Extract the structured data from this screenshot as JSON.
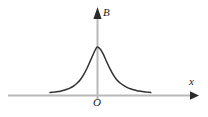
{
  "figure": {
    "background_color": "#ffffff",
    "axis_color": "#b3b3b3",
    "arrow_color": "#2b2b2b",
    "curve_color": "#33312f",
    "label_color": "#1a1a1a"
  },
  "labels": {
    "y_axis": "B",
    "x_axis": "x",
    "origin": "O"
  },
  "icons": {
    "y_arrow": "arrow-up-icon",
    "x_arrow": "arrow-right-icon"
  },
  "chart_data": {
    "type": "line",
    "title": "",
    "subtitle": "",
    "xlabel": "x",
    "ylabel": "B",
    "annotations": [
      "O"
    ],
    "legend": [],
    "legend_position": "none",
    "grid": false,
    "axis_style": "arrow-terminated",
    "xlim": [
      -70,
      100
    ],
    "ylim": [
      0,
      1.15
    ],
    "x_origin_px": 97,
    "y_baseline_px": 95,
    "series": [
      {
        "name": "B(x)",
        "x": [
          -69,
          -64,
          -59,
          -54,
          -49,
          -44,
          -39,
          -34,
          -29,
          -24,
          -19,
          -14,
          -9,
          -4,
          0,
          4,
          9,
          14,
          19,
          24,
          29,
          34,
          39,
          44,
          49,
          54,
          59,
          64,
          69,
          74,
          79
        ],
        "values": [
          0.05,
          0.06,
          0.07,
          0.08,
          0.1,
          0.12,
          0.15,
          0.19,
          0.25,
          0.33,
          0.44,
          0.58,
          0.74,
          0.9,
          1.0,
          0.97,
          0.86,
          0.7,
          0.55,
          0.42,
          0.32,
          0.25,
          0.2,
          0.16,
          0.13,
          0.11,
          0.09,
          0.08,
          0.07,
          0.06,
          0.05
        ]
      }
    ]
  }
}
